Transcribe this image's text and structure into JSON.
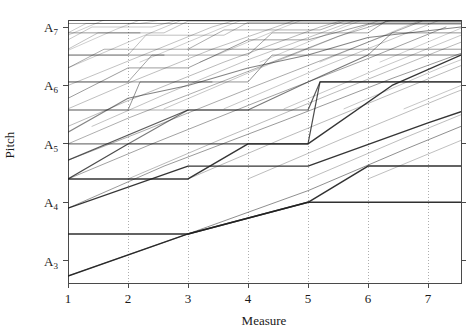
{
  "chart_data": {
    "type": "line",
    "title": "",
    "xlabel": "Measure",
    "ylabel": "Pitch",
    "xlim": [
      1,
      7.55
    ],
    "ylim": [
      2.62,
      7.12
    ],
    "grid": "vertical-dotted",
    "legend": "none",
    "x_ticks": [
      {
        "value": 1,
        "label": "1"
      },
      {
        "value": 2,
        "label": "2"
      },
      {
        "value": 3,
        "label": "3"
      },
      {
        "value": 4,
        "label": "4"
      },
      {
        "value": 5,
        "label": "5"
      },
      {
        "value": 6,
        "label": "6"
      },
      {
        "value": 7,
        "label": "7"
      }
    ],
    "y_ticks": [
      {
        "value": 3,
        "label": "A",
        "sub": "3"
      },
      {
        "value": 4,
        "label": "A",
        "sub": "4"
      },
      {
        "value": 5,
        "label": "A",
        "sub": "5"
      },
      {
        "value": 6,
        "label": "A",
        "sub": "6"
      },
      {
        "value": 7,
        "label": "A",
        "sub": "7"
      }
    ],
    "series": [
      {
        "name": "voice-1",
        "opacity": 0.92,
        "width": 1.5,
        "points": [
          [
            1.0,
            2.74
          ],
          [
            3.0,
            3.46
          ],
          [
            5.0,
            4.0
          ],
          [
            5.0,
            4.0
          ],
          [
            7.55,
            4.0
          ]
        ]
      },
      {
        "name": "voice-2",
        "opacity": 0.92,
        "width": 1.5,
        "points": [
          [
            1.0,
            3.46
          ],
          [
            1.0,
            3.46
          ],
          [
            3.0,
            3.46
          ],
          [
            5.0,
            4.0
          ],
          [
            6.0,
            4.62
          ],
          [
            7.55,
            4.62
          ]
        ]
      },
      {
        "name": "voice-3",
        "opacity": 0.9,
        "width": 1.4,
        "points": [
          [
            1.0,
            3.9
          ],
          [
            3.0,
            4.62
          ],
          [
            5.0,
            4.62
          ],
          [
            7.0,
            5.36
          ],
          [
            7.55,
            5.55
          ]
        ]
      },
      {
        "name": "voice-4",
        "opacity": 0.9,
        "width": 1.4,
        "points": [
          [
            1.0,
            4.4
          ],
          [
            1.0,
            4.4
          ],
          [
            3.0,
            4.4
          ],
          [
            4.0,
            5.0
          ],
          [
            5.0,
            5.0
          ],
          [
            6.4,
            6.0
          ],
          [
            7.55,
            6.52
          ]
        ]
      },
      {
        "name": "voice-5",
        "opacity": 0.8,
        "width": 1.2,
        "points": [
          [
            1.0,
            4.4
          ],
          [
            2.0,
            5.0
          ],
          [
            3.0,
            5.0
          ],
          [
            4.0,
            5.0
          ],
          [
            5.0,
            5.0
          ],
          [
            5.2,
            6.06
          ],
          [
            7.0,
            6.06
          ],
          [
            7.55,
            6.06
          ]
        ]
      },
      {
        "name": "voice-6",
        "opacity": 0.72,
        "width": 1.2,
        "points": [
          [
            1.0,
            4.72
          ],
          [
            3.0,
            5.58
          ],
          [
            5.0,
            5.58
          ],
          [
            5.2,
            6.06
          ],
          [
            7.55,
            6.06
          ]
        ]
      },
      {
        "name": "voice-7",
        "opacity": 0.6,
        "width": 1.1,
        "points": [
          [
            1.0,
            5.0
          ],
          [
            2.0,
            5.0
          ],
          [
            3.0,
            5.58
          ],
          [
            4.0,
            5.58
          ],
          [
            5.0,
            6.06
          ],
          [
            6.0,
            6.52
          ],
          [
            7.55,
            6.52
          ]
        ]
      },
      {
        "name": "voice-8",
        "opacity": 0.55,
        "width": 1.1,
        "points": [
          [
            1.0,
            5.2
          ],
          [
            2.0,
            5.78
          ],
          [
            3.0,
            6.0
          ],
          [
            4.0,
            6.3
          ],
          [
            5.0,
            6.52
          ],
          [
            6.0,
            6.82
          ],
          [
            7.55,
            7.0
          ]
        ]
      },
      {
        "name": "voice-9",
        "opacity": 0.48,
        "width": 1.0,
        "points": [
          [
            1.0,
            5.58
          ],
          [
            2.0,
            5.58
          ],
          [
            2.2,
            6.06
          ],
          [
            4.0,
            6.06
          ],
          [
            4.4,
            6.52
          ],
          [
            6.0,
            6.52
          ],
          [
            6.4,
            6.9
          ],
          [
            7.55,
            6.9
          ]
        ]
      },
      {
        "name": "voice-10",
        "opacity": 0.44,
        "width": 1.0,
        "points": [
          [
            1.0,
            5.78
          ],
          [
            2.0,
            6.3
          ],
          [
            3.0,
            6.3
          ],
          [
            4.0,
            6.78
          ],
          [
            5.0,
            6.78
          ],
          [
            6.0,
            7.05
          ],
          [
            7.55,
            7.05
          ]
        ]
      },
      {
        "name": "voice-11",
        "opacity": 0.4,
        "width": 1.0,
        "points": [
          [
            1.0,
            6.06
          ],
          [
            2.0,
            6.06
          ],
          [
            2.4,
            6.52
          ],
          [
            4.0,
            6.52
          ],
          [
            4.4,
            6.9
          ],
          [
            6.0,
            6.9
          ],
          [
            6.3,
            7.1
          ],
          [
            7.55,
            7.1
          ]
        ]
      },
      {
        "name": "voice-12",
        "opacity": 0.36,
        "width": 1.0,
        "points": [
          [
            1.0,
            6.3
          ],
          [
            1.6,
            6.62
          ],
          [
            3.0,
            6.62
          ],
          [
            3.6,
            6.95
          ],
          [
            5.2,
            6.95
          ],
          [
            5.6,
            7.1
          ],
          [
            7.55,
            7.1
          ]
        ]
      },
      {
        "name": "voice-13",
        "opacity": 0.32,
        "width": 0.9,
        "points": [
          [
            1.0,
            6.52
          ],
          [
            2.0,
            6.52
          ],
          [
            2.3,
            6.86
          ],
          [
            3.6,
            6.86
          ],
          [
            4.0,
            7.08
          ],
          [
            7.55,
            7.08
          ]
        ]
      },
      {
        "name": "voice-14",
        "opacity": 0.3,
        "width": 0.9,
        "points": [
          [
            1.0,
            6.62
          ],
          [
            1.5,
            6.9
          ],
          [
            2.6,
            6.9
          ],
          [
            3.0,
            7.1
          ],
          [
            7.55,
            7.1
          ]
        ]
      },
      {
        "name": "voice-15",
        "opacity": 0.28,
        "width": 0.9,
        "points": [
          [
            1.0,
            6.78
          ],
          [
            1.4,
            7.0
          ],
          [
            2.4,
            7.0
          ],
          [
            2.8,
            7.11
          ],
          [
            7.55,
            7.11
          ]
        ]
      },
      {
        "name": "voice-16",
        "opacity": 0.26,
        "width": 0.9,
        "points": [
          [
            1.0,
            6.9
          ],
          [
            1.3,
            7.06
          ],
          [
            2.2,
            7.06
          ],
          [
            2.5,
            7.11
          ],
          [
            7.55,
            7.11
          ]
        ]
      },
      {
        "name": "diag-1",
        "opacity": 0.5,
        "width": 1.0,
        "points": [
          [
            1.0,
            2.74
          ],
          [
            3.0,
            3.46
          ],
          [
            5.0,
            4.2
          ],
          [
            6.6,
            4.9
          ],
          [
            7.55,
            5.3
          ]
        ]
      },
      {
        "name": "diag-2",
        "opacity": 0.45,
        "width": 1.0,
        "points": [
          [
            1.0,
            3.9
          ],
          [
            2.6,
            4.62
          ],
          [
            4.6,
            5.4
          ],
          [
            6.4,
            6.12
          ],
          [
            7.55,
            6.55
          ]
        ]
      },
      {
        "name": "diag-3",
        "opacity": 0.42,
        "width": 1.0,
        "points": [
          [
            1.0,
            4.4
          ],
          [
            2.4,
            5.0
          ],
          [
            4.2,
            5.74
          ],
          [
            6.0,
            6.46
          ],
          [
            7.3,
            7.0
          ]
        ]
      },
      {
        "name": "diag-4",
        "opacity": 0.4,
        "width": 0.95,
        "points": [
          [
            1.0,
            4.72
          ],
          [
            2.2,
            5.2
          ],
          [
            4.0,
            5.94
          ],
          [
            5.8,
            6.66
          ],
          [
            6.9,
            7.1
          ]
        ]
      },
      {
        "name": "diag-5",
        "opacity": 0.38,
        "width": 0.95,
        "points": [
          [
            1.0,
            5.0
          ],
          [
            2.0,
            5.44
          ],
          [
            3.8,
            6.16
          ],
          [
            5.5,
            6.84
          ],
          [
            6.4,
            7.12
          ]
        ]
      },
      {
        "name": "diag-6",
        "opacity": 0.34,
        "width": 0.9,
        "points": [
          [
            1.0,
            5.3
          ],
          [
            2.0,
            5.74
          ],
          [
            3.6,
            6.4
          ],
          [
            5.2,
            7.0
          ],
          [
            5.6,
            7.12
          ]
        ]
      },
      {
        "name": "diag-7",
        "opacity": 0.32,
        "width": 0.9,
        "points": [
          [
            1.0,
            5.6
          ],
          [
            2.0,
            6.04
          ],
          [
            3.4,
            6.62
          ],
          [
            4.8,
            7.12
          ]
        ]
      },
      {
        "name": "diag-8",
        "opacity": 0.3,
        "width": 0.9,
        "points": [
          [
            1.4,
            5.3
          ],
          [
            2.6,
            5.84
          ],
          [
            4.0,
            6.44
          ],
          [
            5.8,
            7.12
          ]
        ]
      },
      {
        "name": "diag-9",
        "opacity": 0.3,
        "width": 0.9,
        "points": [
          [
            1.0,
            6.0
          ],
          [
            2.2,
            6.5
          ],
          [
            3.4,
            7.0
          ],
          [
            3.8,
            7.12
          ]
        ]
      },
      {
        "name": "diag-10",
        "opacity": 0.28,
        "width": 0.85,
        "points": [
          [
            1.0,
            6.3
          ],
          [
            2.0,
            6.74
          ],
          [
            2.9,
            7.12
          ]
        ]
      },
      {
        "name": "diag-11",
        "opacity": 0.26,
        "width": 0.85,
        "points": [
          [
            1.0,
            6.6
          ],
          [
            1.8,
            6.96
          ],
          [
            2.2,
            7.12
          ]
        ]
      },
      {
        "name": "diag-12",
        "opacity": 0.26,
        "width": 0.85,
        "points": [
          [
            1.0,
            6.86
          ],
          [
            1.6,
            7.12
          ]
        ]
      },
      {
        "name": "diag-13",
        "opacity": 0.35,
        "width": 0.9,
        "points": [
          [
            2.0,
            4.4
          ],
          [
            3.6,
            5.1
          ],
          [
            5.4,
            5.86
          ],
          [
            7.2,
            6.6
          ],
          [
            7.55,
            6.74
          ]
        ]
      },
      {
        "name": "diag-14",
        "opacity": 0.35,
        "width": 0.9,
        "points": [
          [
            3.0,
            4.4
          ],
          [
            4.6,
            5.1
          ],
          [
            6.4,
            5.86
          ],
          [
            7.55,
            6.34
          ]
        ]
      },
      {
        "name": "diag-15",
        "opacity": 0.33,
        "width": 0.9,
        "points": [
          [
            4.0,
            4.4
          ],
          [
            5.6,
            5.1
          ],
          [
            7.4,
            5.86
          ],
          [
            7.55,
            5.92
          ]
        ]
      },
      {
        "name": "diag-16",
        "opacity": 0.33,
        "width": 0.9,
        "points": [
          [
            5.0,
            4.4
          ],
          [
            6.6,
            5.1
          ],
          [
            7.55,
            5.5
          ]
        ]
      },
      {
        "name": "diag-17",
        "opacity": 0.32,
        "width": 0.9,
        "points": [
          [
            6.0,
            4.4
          ],
          [
            7.55,
            5.06
          ]
        ]
      },
      {
        "name": "diag-18",
        "opacity": 0.3,
        "width": 0.85,
        "points": [
          [
            2.6,
            5.6
          ],
          [
            4.2,
            6.3
          ],
          [
            6.0,
            7.04
          ],
          [
            6.2,
            7.12
          ]
        ]
      },
      {
        "name": "diag-19",
        "opacity": 0.3,
        "width": 0.85,
        "points": [
          [
            3.6,
            5.6
          ],
          [
            5.2,
            6.3
          ],
          [
            7.0,
            7.04
          ],
          [
            7.2,
            7.12
          ]
        ]
      },
      {
        "name": "diag-20",
        "opacity": 0.3,
        "width": 0.85,
        "points": [
          [
            4.6,
            5.6
          ],
          [
            6.2,
            6.3
          ],
          [
            7.55,
            6.86
          ]
        ]
      },
      {
        "name": "diag-21",
        "opacity": 0.3,
        "width": 0.85,
        "points": [
          [
            5.6,
            5.6
          ],
          [
            7.2,
            6.3
          ],
          [
            7.55,
            6.44
          ]
        ]
      },
      {
        "name": "diag-22",
        "opacity": 0.3,
        "width": 0.85,
        "points": [
          [
            6.6,
            5.6
          ],
          [
            7.55,
            6.0
          ]
        ]
      },
      {
        "name": "diag-23",
        "opacity": 0.28,
        "width": 0.8,
        "points": [
          [
            2.2,
            6.4
          ],
          [
            3.6,
            7.0
          ],
          [
            3.9,
            7.12
          ]
        ]
      },
      {
        "name": "diag-24",
        "opacity": 0.28,
        "width": 0.8,
        "points": [
          [
            3.2,
            6.4
          ],
          [
            4.6,
            7.0
          ],
          [
            4.9,
            7.12
          ]
        ]
      },
      {
        "name": "diag-25",
        "opacity": 0.28,
        "width": 0.8,
        "points": [
          [
            4.2,
            6.4
          ],
          [
            5.6,
            7.0
          ],
          [
            5.9,
            7.12
          ]
        ]
      },
      {
        "name": "diag-26",
        "opacity": 0.28,
        "width": 0.8,
        "points": [
          [
            5.2,
            6.4
          ],
          [
            6.6,
            7.0
          ],
          [
            6.9,
            7.12
          ]
        ]
      },
      {
        "name": "diag-27",
        "opacity": 0.28,
        "width": 0.8,
        "points": [
          [
            6.2,
            6.4
          ],
          [
            7.55,
            6.98
          ]
        ]
      },
      {
        "name": "plateau-a",
        "opacity": 0.5,
        "width": 1.0,
        "points": [
          [
            1.0,
            6.06
          ],
          [
            3.4,
            6.06
          ]
        ]
      },
      {
        "name": "plateau-b",
        "opacity": 0.5,
        "width": 1.0,
        "points": [
          [
            1.0,
            6.52
          ],
          [
            2.6,
            6.52
          ]
        ]
      },
      {
        "name": "plateau-c",
        "opacity": 0.45,
        "width": 1.0,
        "points": [
          [
            1.0,
            6.9
          ],
          [
            2.2,
            6.9
          ]
        ]
      },
      {
        "name": "plateau-d",
        "opacity": 0.45,
        "width": 1.0,
        "points": [
          [
            1.0,
            7.06
          ],
          [
            7.55,
            7.06
          ]
        ]
      },
      {
        "name": "plateau-e",
        "opacity": 0.45,
        "width": 1.0,
        "points": [
          [
            3.0,
            6.62
          ],
          [
            7.55,
            6.62
          ]
        ]
      },
      {
        "name": "plateau-f",
        "opacity": 0.4,
        "width": 0.95,
        "points": [
          [
            1.0,
            5.58
          ],
          [
            3.0,
            5.58
          ]
        ]
      }
    ]
  },
  "colors": {
    "axis": "#4a4a4a",
    "grid": "#9a9a9a",
    "line": "#1f1f1f",
    "background": "#ffffff",
    "text": "#1a1a1a"
  }
}
